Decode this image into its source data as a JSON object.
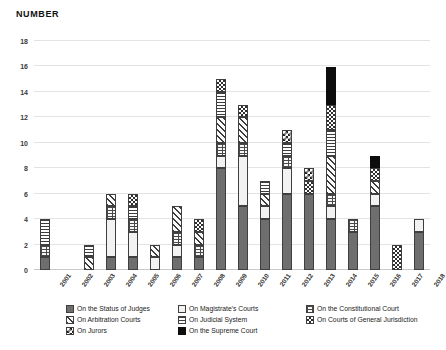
{
  "chart": {
    "title": "NUMBER"
  },
  "chart_data": {
    "type": "bar",
    "subtype": "stacked-bar",
    "title": "NUMBER",
    "xlabel": "",
    "ylabel": "NUMBER",
    "ylim": [
      0,
      18
    ],
    "ytick_step": 2,
    "yticks": [
      0,
      2,
      4,
      6,
      8,
      10,
      12,
      14,
      16,
      18
    ],
    "grid": true,
    "legend_position": "bottom",
    "categories": [
      "2001",
      "2002",
      "2003",
      "2004",
      "2005",
      "2006",
      "2007",
      "2008",
      "2009",
      "2010",
      "2011",
      "2012",
      "2013",
      "2014",
      "2015",
      "2016",
      "2017",
      "2018"
    ],
    "series": [
      {
        "name": "On the Status of Judges",
        "pattern": "solid-dark-gray",
        "values": [
          1,
          0,
          0,
          1,
          1,
          0,
          1,
          1,
          8,
          5,
          4,
          6,
          6,
          4,
          3,
          5,
          0,
          3
        ]
      },
      {
        "name": "On Magistrate's Courts",
        "pattern": "dotted-speckle",
        "values": [
          0,
          0,
          0,
          3,
          2,
          1,
          1,
          0,
          1,
          4,
          1,
          2,
          0,
          1,
          0,
          1,
          0,
          1
        ]
      },
      {
        "name": "On the Constitutional Court",
        "pattern": "brick-grid",
        "values": [
          1,
          0,
          0,
          1,
          1,
          0,
          1,
          1,
          1,
          1,
          0,
          1,
          0,
          1,
          1,
          0,
          0,
          0
        ]
      },
      {
        "name": "On Arbitration Courts",
        "pattern": "diagonal-hatch",
        "values": [
          0,
          0,
          1,
          1,
          0,
          1,
          2,
          1,
          2,
          2,
          1,
          0,
          0,
          3,
          0,
          1,
          0,
          0
        ]
      },
      {
        "name": "On Judicial System",
        "pattern": "horizontal-lines",
        "values": [
          2,
          0,
          1,
          0,
          1,
          0,
          0,
          0,
          2,
          0,
          1,
          1,
          0,
          2,
          0,
          0,
          0,
          0
        ]
      },
      {
        "name": "On Courts of General Jurisdiction",
        "pattern": "checkerboard",
        "values": [
          0,
          0,
          0,
          0,
          1,
          0,
          0,
          1,
          1,
          1,
          0,
          0,
          1,
          2,
          0,
          1,
          2,
          0
        ]
      },
      {
        "name": "On Jurors",
        "pattern": "dense-check",
        "values": [
          0,
          0,
          0,
          0,
          0,
          0,
          0,
          0,
          0,
          0,
          0,
          1,
          1,
          0,
          0,
          0,
          0,
          0
        ]
      },
      {
        "name": "On the Supreme Court",
        "pattern": "solid-black",
        "values": [
          0,
          0,
          0,
          0,
          0,
          0,
          0,
          0,
          0,
          0,
          0,
          0,
          0,
          3,
          0,
          1,
          0,
          0
        ]
      }
    ],
    "totals": [
      4,
      0,
      2,
      6,
      6,
      2,
      5,
      4,
      15,
      13,
      7,
      11,
      8,
      16,
      4,
      9,
      2,
      4
    ]
  },
  "legend": {
    "items": [
      {
        "label": "On the Status of Judges",
        "pattern": "p-status"
      },
      {
        "label": "On Magistrate's Courts",
        "pattern": "p-magistrate"
      },
      {
        "label": "On the Constitutional Court",
        "pattern": "p-constitutional"
      },
      {
        "label": "On Arbitration Courts",
        "pattern": "p-arbitration"
      },
      {
        "label": "On Judicial System",
        "pattern": "p-judicial"
      },
      {
        "label": "On Courts of General Jurisdiction",
        "pattern": "p-general"
      },
      {
        "label": "On Jurors",
        "pattern": "p-jurors"
      },
      {
        "label": "On the Supreme Court",
        "pattern": "p-supreme"
      }
    ],
    "column_order": [
      0,
      1,
      2,
      3,
      4,
      5,
      6,
      7
    ]
  }
}
